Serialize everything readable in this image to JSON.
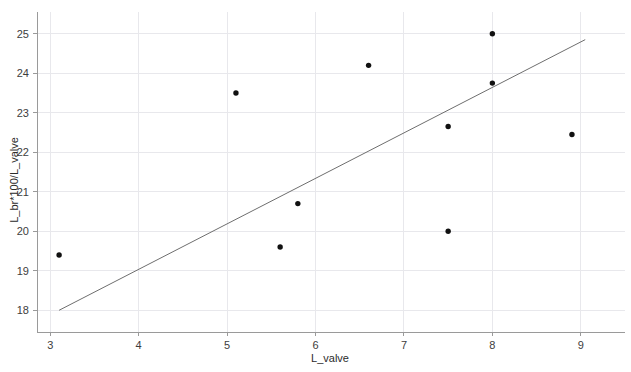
{
  "chart_data": {
    "type": "scatter",
    "title": "",
    "xlabel": "L_valve",
    "ylabel": "L_br*100/L_valve",
    "xlim": [
      2.85,
      9.5
    ],
    "ylim": [
      17.45,
      25.55
    ],
    "xticks": [
      3,
      4,
      5,
      6,
      7,
      8,
      9
    ],
    "yticks": [
      18,
      19,
      20,
      21,
      22,
      23,
      24,
      25
    ],
    "xtick_labels": [
      "3",
      "4",
      "5",
      "6",
      "7",
      "8",
      "9"
    ],
    "ytick_labels": [
      "18",
      "19",
      "20",
      "21",
      "22",
      "23",
      "24",
      "25"
    ],
    "grid": true,
    "legend": "none",
    "points": [
      {
        "x": 3.1,
        "y": 19.4
      },
      {
        "x": 5.1,
        "y": 23.5
      },
      {
        "x": 5.6,
        "y": 19.6
      },
      {
        "x": 5.8,
        "y": 20.7
      },
      {
        "x": 6.6,
        "y": 24.2
      },
      {
        "x": 7.5,
        "y": 20.0
      },
      {
        "x": 7.5,
        "y": 22.65
      },
      {
        "x": 8.0,
        "y": 23.75
      },
      {
        "x": 8.0,
        "y": 25.0
      },
      {
        "x": 8.9,
        "y": 22.45
      }
    ],
    "trend_line": {
      "x0": 3.1,
      "y0": 18.0,
      "x1": 9.05,
      "y1": 24.85
    },
    "colors": {
      "point": "#111111",
      "trend": "#6e6e6e",
      "grid": "#e8e8ec",
      "axis": "#9a9a9a",
      "text": "#3d3d3d",
      "background": "#ffffff"
    }
  }
}
